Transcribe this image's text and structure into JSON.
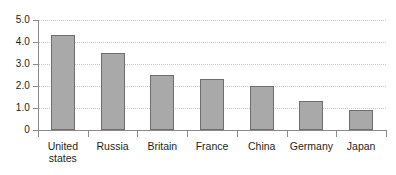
{
  "chart_data": {
    "type": "bar",
    "title": "",
    "subtitle": "",
    "xlabel": "",
    "ylabel": "",
    "categories": [
      "United\nstates",
      "Russia",
      "Britain",
      "France",
      "China",
      "Germany",
      "Japan"
    ],
    "values": [
      4.3,
      3.5,
      2.5,
      2.3,
      2.0,
      1.3,
      0.9
    ],
    "ylim": [
      0,
      5.0
    ],
    "ytick_values": [
      0,
      1.0,
      2.0,
      3.0,
      4.0,
      5.0
    ],
    "ytick_labels": [
      "0",
      "1.0",
      "2.0",
      "3.0",
      "4.0",
      "5.0"
    ],
    "grid": true,
    "grid_axis": "y",
    "grid_style": "dotted",
    "legend": null,
    "legend_position": "none",
    "annotations": [],
    "series": [
      {
        "name": "",
        "values": [
          4.3,
          3.5,
          2.5,
          2.3,
          2.0,
          1.3,
          0.9
        ]
      }
    ]
  },
  "colors": {
    "bar_fill": "#a9a9a9",
    "bar_border": "#6e6e6e",
    "axis_line": "#8a8a8a",
    "gridline": "#c9c9c9",
    "text": "#231f20",
    "background": "#ffffff"
  }
}
